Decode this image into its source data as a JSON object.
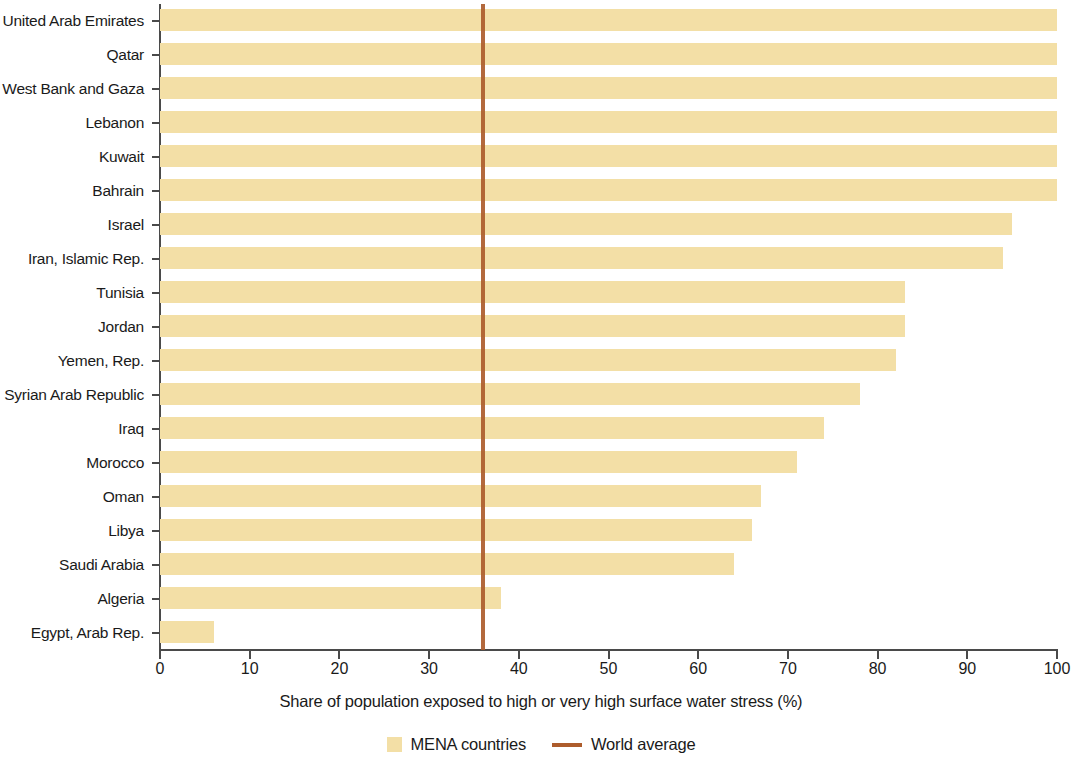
{
  "chart_data": {
    "type": "bar",
    "orientation": "horizontal",
    "title": "",
    "xlabel": "Share of population exposed to high or very high surface water stress (%)",
    "ylabel": "",
    "xlim": [
      0,
      100
    ],
    "xticks": [
      0,
      10,
      20,
      30,
      40,
      50,
      60,
      70,
      80,
      90,
      100
    ],
    "xtick_labels": [
      "0",
      "10",
      "20",
      "30",
      "40",
      "50",
      "60",
      "70",
      "80",
      "90",
      "100"
    ],
    "grid": false,
    "legend_position": "bottom",
    "categories": [
      "United Arab Emirates",
      "Qatar",
      "West Bank and Gaza",
      "Lebanon",
      "Kuwait",
      "Bahrain",
      "Israel",
      "Iran, Islamic Rep.",
      "Tunisia",
      "Jordan",
      "Yemen, Rep.",
      "Syrian Arab Republic",
      "Iraq",
      "Morocco",
      "Oman",
      "Libya",
      "Saudi Arabia",
      "Algeria",
      "Egypt, Arab Rep."
    ],
    "values": [
      100,
      100,
      100,
      100,
      100,
      100,
      95,
      94,
      83,
      83,
      82,
      78,
      74,
      71,
      67,
      66,
      64,
      38,
      6
    ],
    "series": [
      {
        "name": "MENA countries",
        "values": [
          100,
          100,
          100,
          100,
          100,
          100,
          95,
          94,
          83,
          83,
          82,
          78,
          74,
          71,
          67,
          66,
          64,
          38,
          6
        ],
        "color": "#f3dfa6"
      }
    ],
    "reference_line": {
      "name": "World average",
      "value": 36,
      "color": "#ad5c2c",
      "orientation": "vertical"
    },
    "legend": [
      {
        "label": "MENA countries",
        "marker": "swatch",
        "color": "#f3dfa6"
      },
      {
        "label": "World average",
        "marker": "line",
        "color": "#ad5c2c"
      }
    ]
  }
}
